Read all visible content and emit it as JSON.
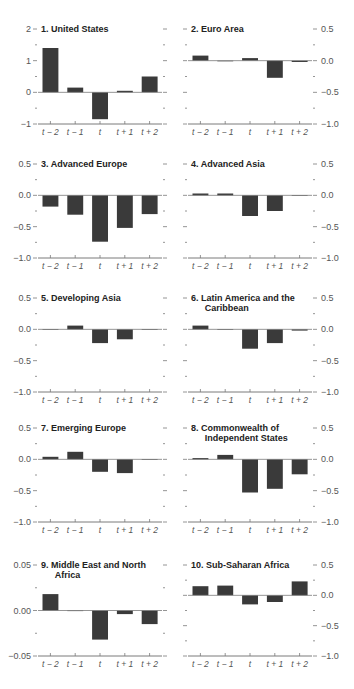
{
  "colors": {
    "bar": "#3a3a3a",
    "axis": "#7a7a7a",
    "tick_label": "#555555",
    "title": "#222222"
  },
  "categories": [
    "t − 2",
    "t − 1",
    "t",
    "t + 1",
    "t + 2"
  ],
  "chart_data": [
    {
      "type": "bar",
      "title": "1. United States",
      "categories": [
        "t-2",
        "t-1",
        "t",
        "t+1",
        "t+2"
      ],
      "values": [
        1.4,
        0.15,
        -0.85,
        0.05,
        0.5
      ],
      "ylim": [
        -1,
        2
      ],
      "yticks": [
        -1,
        0,
        1,
        2
      ],
      "ytick_labels": [
        "−1",
        "0",
        "1",
        "2"
      ],
      "axis_side": "left",
      "grid": false
    },
    {
      "type": "bar",
      "title": "2. Euro Area",
      "categories": [
        "t-2",
        "t-1",
        "t",
        "t+1",
        "t+2"
      ],
      "values": [
        0.08,
        0.0,
        0.04,
        -0.27,
        -0.02
      ],
      "ylim": [
        -1.0,
        0.5
      ],
      "yticks": [
        -1.0,
        -0.5,
        0.0,
        0.5
      ],
      "ytick_labels": [
        "−1.0",
        "−0.5",
        "0.0",
        "0.5"
      ],
      "axis_side": "right",
      "grid": false
    },
    {
      "type": "bar",
      "title": "3. Advanced Europe",
      "categories": [
        "t-2",
        "t-1",
        "t",
        "t+1",
        "t+2"
      ],
      "values": [
        -0.18,
        -0.31,
        -0.74,
        -0.52,
        -0.3
      ],
      "ylim": [
        -1.0,
        0.5
      ],
      "yticks": [
        -1.0,
        -0.5,
        0.0,
        0.5
      ],
      "ytick_labels": [
        "−1.0",
        "−0.5",
        "0.0",
        "0.5"
      ],
      "axis_side": "left",
      "grid": false
    },
    {
      "type": "bar",
      "title": "4. Advanced Asia",
      "categories": [
        "t-2",
        "t-1",
        "t",
        "t+1",
        "t+2"
      ],
      "values": [
        0.03,
        0.03,
        -0.33,
        -0.25,
        0.0
      ],
      "ylim": [
        -1.0,
        0.5
      ],
      "yticks": [
        -1.0,
        -0.5,
        0.0,
        0.5
      ],
      "ytick_labels": [
        "−1.0",
        "−0.5",
        "0.0",
        "0.5"
      ],
      "axis_side": "right",
      "grid": false
    },
    {
      "type": "bar",
      "title": "5. Developing Asia",
      "categories": [
        "t-2",
        "t-1",
        "t",
        "t+1",
        "t+2"
      ],
      "values": [
        -0.01,
        0.06,
        -0.22,
        -0.16,
        -0.01
      ],
      "ylim": [
        -1.0,
        0.5
      ],
      "yticks": [
        -1.0,
        -0.5,
        0.0,
        0.5
      ],
      "ytick_labels": [
        "−1.0",
        "−0.5",
        "0.0",
        "0.5"
      ],
      "axis_side": "left",
      "grid": false
    },
    {
      "type": "bar",
      "title": "6. Latin America and the Caribbean",
      "title_lines": [
        "6. Latin America and the",
        "Caribbean"
      ],
      "categories": [
        "t-2",
        "t-1",
        "t",
        "t+1",
        "t+2"
      ],
      "values": [
        0.06,
        0.0,
        -0.31,
        -0.22,
        -0.02
      ],
      "ylim": [
        -1.0,
        0.5
      ],
      "yticks": [
        -1.0,
        -0.5,
        0.0,
        0.5
      ],
      "ytick_labels": [
        "−1.0",
        "−0.5",
        "0.0",
        "0.5"
      ],
      "axis_side": "right",
      "grid": false
    },
    {
      "type": "bar",
      "title": "7. Emerging Europe",
      "categories": [
        "t-2",
        "t-1",
        "t",
        "t+1",
        "t+2"
      ],
      "values": [
        0.04,
        0.12,
        -0.2,
        -0.22,
        -0.01
      ],
      "ylim": [
        -1.0,
        0.5
      ],
      "yticks": [
        -1.0,
        -0.5,
        0.0,
        0.5
      ],
      "ytick_labels": [
        "−1.0",
        "−0.5",
        "0.0",
        "0.5"
      ],
      "axis_side": "left",
      "grid": false
    },
    {
      "type": "bar",
      "title": "8. Commonwealth of Independent States",
      "title_lines": [
        "8. Commonwealth of",
        "Independent States"
      ],
      "categories": [
        "t-2",
        "t-1",
        "t",
        "t+1",
        "t+2"
      ],
      "values": [
        0.02,
        0.07,
        -0.53,
        -0.47,
        -0.24
      ],
      "ylim": [
        -1.0,
        0.5
      ],
      "yticks": [
        -1.0,
        -0.5,
        0.0,
        0.5
      ],
      "ytick_labels": [
        "−1.0",
        "−0.5",
        "0.0",
        "0.5"
      ],
      "axis_side": "right",
      "grid": false
    },
    {
      "type": "bar",
      "title": "9. Middle East and North Africa",
      "title_lines": [
        "9. Middle East and North",
        "Africa"
      ],
      "categories": [
        "t-2",
        "t-1",
        "t",
        "t+1",
        "t+2"
      ],
      "values": [
        0.018,
        0.0,
        -0.032,
        -0.004,
        -0.015
      ],
      "ylim": [
        -0.05,
        0.05
      ],
      "yticks": [
        -0.05,
        0.0,
        0.05
      ],
      "ytick_labels": [
        "−0.05",
        "0.00",
        "0.05"
      ],
      "minor_ticks": [
        -0.025,
        0.025
      ],
      "axis_side": "left",
      "grid": false
    },
    {
      "type": "bar",
      "title": "10. Sub-Saharan Africa",
      "categories": [
        "t-2",
        "t-1",
        "t",
        "t+1",
        "t+2"
      ],
      "values": [
        0.15,
        0.16,
        -0.15,
        -0.11,
        0.23
      ],
      "ylim": [
        -1.0,
        0.5
      ],
      "yticks": [
        -1.0,
        -0.5,
        0.0,
        0.5
      ],
      "ytick_labels": [
        "−1.0",
        "−0.5",
        "0.0",
        "0.5"
      ],
      "axis_side": "right",
      "grid": false
    }
  ]
}
